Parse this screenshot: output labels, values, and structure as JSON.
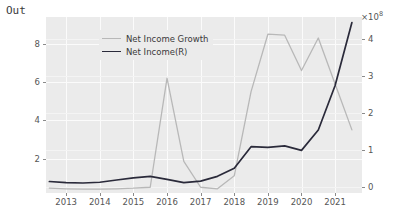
{
  "notebook": {
    "out_prompt": "Out"
  },
  "chart_data": {
    "type": "line",
    "title": "",
    "xlabel": "",
    "ylabel": "",
    "grid": true,
    "legend_position": "upper-left",
    "x": [
      2012.5,
      2013,
      2013.5,
      2014,
      2014.5,
      2015,
      2015.5,
      2016,
      2016.5,
      2017,
      2017.5,
      2018,
      2018.5,
      2019,
      2019.5,
      2020,
      2020.5,
      2021,
      2021.5
    ],
    "xtick_labels": [
      "2013",
      "2014",
      "2015",
      "2016",
      "2017",
      "2018",
      "2019",
      "2020",
      "2021"
    ],
    "xtick_values": [
      2013,
      2014,
      2015,
      2016,
      2017,
      2018,
      2019,
      2020,
      2021
    ],
    "xlim": [
      2012.4,
      2021.8
    ],
    "left_axis": {
      "ylim": [
        0.2,
        9.4
      ],
      "tick_labels": [
        "2",
        "4",
        "6",
        "8"
      ],
      "tick_values": [
        2,
        4,
        6,
        8
      ]
    },
    "right_axis": {
      "ylim": [
        -0.15,
        4.6
      ],
      "exponent": "×10",
      "exponent_power": "8",
      "tick_labels": [
        "0",
        "1",
        "2",
        "3",
        "4"
      ],
      "tick_values": [
        0,
        1,
        2,
        3,
        4
      ]
    },
    "series": [
      {
        "name": "Net Income Growth",
        "axis": "left",
        "color": "#b8b8b8",
        "width": 1.3,
        "values": [
          0.45,
          0.42,
          0.4,
          0.4,
          0.42,
          0.45,
          0.5,
          6.2,
          1.85,
          0.5,
          0.42,
          1.1,
          5.5,
          8.5,
          8.45,
          6.6,
          8.3,
          5.9,
          3.5
        ]
      },
      {
        "name": "Net Income(R)",
        "axis": "right",
        "color": "#2a2a3a",
        "width": 1.7,
        "values": [
          0.16,
          0.13,
          0.12,
          0.14,
          0.2,
          0.26,
          0.3,
          0.22,
          0.13,
          0.17,
          0.3,
          0.52,
          1.1,
          1.08,
          1.12,
          1.0,
          1.55,
          2.75,
          4.45
        ]
      }
    ]
  }
}
